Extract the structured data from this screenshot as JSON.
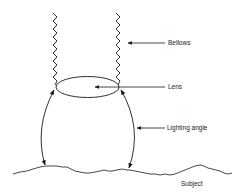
{
  "diagram": {
    "type": "camera bellows lighting angle illustration",
    "labels": {
      "bellows": "Bellows",
      "lens": "Lens",
      "lighting_angle": "Lighting angle",
      "subject": "Subject"
    },
    "colors": {
      "line": "#1a1a1a",
      "text": "#222222",
      "background": "#ffffff"
    }
  }
}
